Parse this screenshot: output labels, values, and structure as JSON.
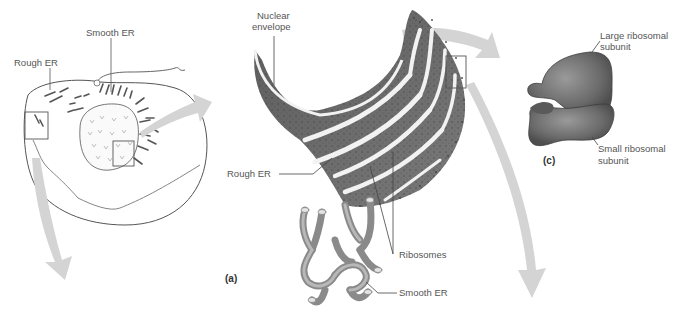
{
  "figure": {
    "panels": {
      "a": "(a)",
      "c": "(c)"
    },
    "cell_overview": {
      "labels": {
        "smooth_er": "Smooth ER",
        "rough_er": "Rough ER"
      }
    },
    "er_detail": {
      "labels": {
        "nuclear_envelope_line1": "Nuclear",
        "nuclear_envelope_line2": "envelope",
        "rough_er": "Rough ER",
        "ribosomes": "Ribosomes",
        "smooth_er": "Smooth ER"
      }
    },
    "ribosome_detail": {
      "labels": {
        "large_subunit_line1": "Large ribosomal",
        "large_subunit_line2": "subunit",
        "small_subunit_line1": "Small ribosomal",
        "small_subunit_line2": "subunit"
      }
    },
    "colors": {
      "arrow": "#d4d4d4",
      "er_fill": "#6e6e6e",
      "er_lumen": "#f2f2f2",
      "ribosome_fill": "#6a6a6a",
      "line": "#555555"
    }
  }
}
